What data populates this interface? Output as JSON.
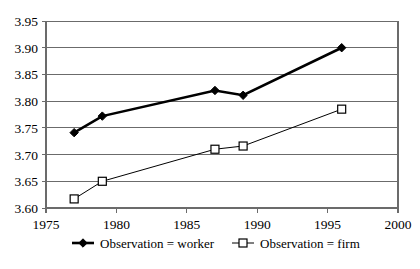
{
  "chart_data": {
    "type": "line",
    "title": "",
    "subtitle": "",
    "xlabel": "",
    "ylabel": "",
    "xlim": [
      1975,
      2000
    ],
    "ylim": [
      3.6,
      3.95
    ],
    "grid": true,
    "grid_axis": "y",
    "legend_position": "bottom",
    "x_ticks": [
      "1975",
      "1980",
      "1985",
      "1990",
      "1995",
      "2000"
    ],
    "x_tick_values": [
      1975,
      1980,
      1985,
      1990,
      1995,
      2000
    ],
    "y_ticks": [
      "3.60",
      "3.65",
      "3.70",
      "3.75",
      "3.80",
      "3.85",
      "3.90",
      "3.95"
    ],
    "y_tick_values": [
      3.6,
      3.65,
      3.7,
      3.75,
      3.8,
      3.85,
      3.9,
      3.95
    ],
    "x": [
      1977,
      1979,
      1987,
      1989,
      1996
    ],
    "series": [
      {
        "name": "Observation = worker",
        "marker": "filled-diamond",
        "color": "#000000",
        "line_width": 2.6,
        "values": [
          3.741,
          3.772,
          3.82,
          3.811,
          3.9
        ]
      },
      {
        "name": "Observation = firm",
        "marker": "open-square",
        "color": "#000000",
        "line_width": 1,
        "values": [
          3.617,
          3.65,
          3.71,
          3.716,
          3.785
        ]
      }
    ]
  },
  "legend": {
    "items": [
      {
        "label": "Observation = worker"
      },
      {
        "label": "Observation = firm"
      }
    ]
  },
  "colors": {
    "axis": "#6b6b6b",
    "grid": "#6b6b6b",
    "series": "#000000",
    "background": "#ffffff"
  }
}
